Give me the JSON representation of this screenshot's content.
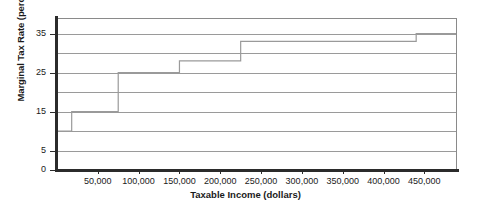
{
  "chart_data": {
    "type": "line",
    "subtype": "step",
    "title": "",
    "xlabel": "Taxable Income (dollars)",
    "ylabel": "Marginal Tax Rate (percent)",
    "xlim": [
      0,
      490000
    ],
    "ylim": [
      0,
      39
    ],
    "grid": "horizontal",
    "legend": "none",
    "x_tick_labels": [
      "50,000",
      "100,000",
      "150,000",
      "200,000",
      "250,000",
      "300,000",
      "350,000",
      "400,000",
      "450,000"
    ],
    "x_tick_values": [
      50000,
      100000,
      150000,
      200000,
      250000,
      300000,
      350000,
      400000,
      450000
    ],
    "y_tick_labels": [
      "0",
      "5",
      "15",
      "25",
      "35"
    ],
    "y_tick_values": [
      0,
      5,
      15,
      25,
      35
    ],
    "y_gridline_values": [
      5,
      10,
      15,
      20,
      25,
      30,
      35
    ],
    "brackets": [
      {
        "label": "10%",
        "rate": 10,
        "income_start": 0,
        "income_end": 18000
      },
      {
        "label": "15%",
        "rate": 15,
        "income_start": 18000,
        "income_end": 75000
      },
      {
        "label": "25%",
        "rate": 25,
        "income_start": 75000,
        "income_end": 150000
      },
      {
        "label": "28%",
        "rate": 28,
        "income_start": 150000,
        "income_end": 225000
      },
      {
        "label": "33%",
        "rate": 33,
        "income_start": 225000,
        "income_end": 440000
      },
      {
        "label": "35%",
        "rate": 35,
        "income_start": 440000,
        "income_end": 490000
      }
    ],
    "x": [
      0,
      18000,
      18000,
      75000,
      75000,
      150000,
      150000,
      225000,
      225000,
      440000,
      440000,
      490000
    ],
    "values": [
      10,
      10,
      15,
      15,
      25,
      25,
      28,
      28,
      33,
      33,
      35,
      35
    ],
    "series": [
      {
        "name": "Marginal tax rate",
        "color": "#9a9a9a",
        "values": [
          10,
          10,
          15,
          15,
          25,
          25,
          28,
          28,
          33,
          33,
          35,
          35
        ]
      }
    ]
  },
  "axes": {
    "x_title": "Taxable Income (dollars)",
    "y_title": "Marginal Tax Rate (percent)"
  },
  "colors": {
    "line": "#9a9a9a",
    "grid": "#9a9a9a",
    "spine": "#2b2b2b",
    "text": "#1a1a1a",
    "background": "#ffffff"
  }
}
